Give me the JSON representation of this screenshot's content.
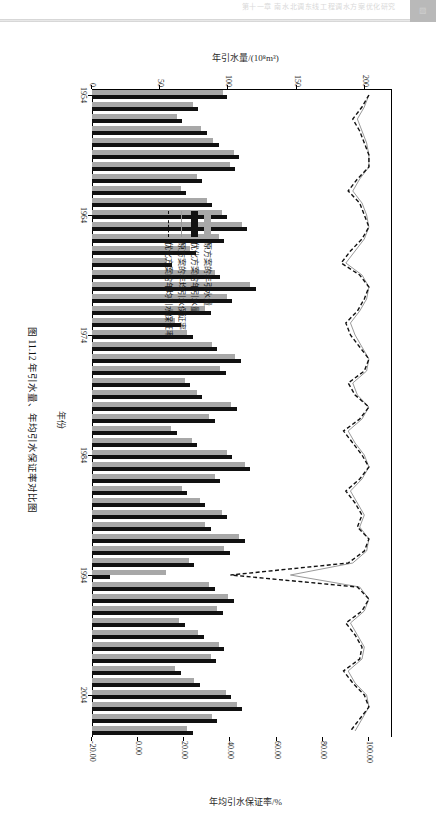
{
  "page": {
    "header_text": "第十一章  南水北调东线工程调水方案优化研究",
    "corner_glyph": "▨"
  },
  "figure": {
    "caption": "图 11.12  年引水量、年均引水保证率对比图",
    "x_axis_title": "年份",
    "y_left_title": "年引水量/(10⁸m³)",
    "y_right_title": "年均引水保证率/%",
    "legend": [
      {
        "label": "原方案的年引水量",
        "style": "bar-gray",
        "color": "#a8a8a8"
      },
      {
        "label": "优化方案的年引水量",
        "style": "bar-black",
        "color": "#111111"
      },
      {
        "label": "原方案的年均引水保证率",
        "style": "line-solid-gray",
        "color": "#9a9a9a"
      },
      {
        "label": "优化方案的年均引水保证率",
        "style": "line-dashed-black",
        "color": "#111111"
      }
    ]
  },
  "chart_data": {
    "type": "bar",
    "title": "图 11.12  年引水量、年均引水保证率对比图",
    "xlabel": "年份",
    "ylabel": "年引水量/(10⁸m³)",
    "y2label": "年均引水保证率/%",
    "ylim": [
      0,
      220
    ],
    "y2lim": [
      -20,
      110
    ],
    "yticks": [
      0,
      50,
      100,
      150,
      200
    ],
    "y2ticks": [
      -20.0,
      0.0,
      20.0,
      40.0,
      60.0,
      80.0,
      100.0
    ],
    "ytick_labels": [
      "0",
      "50",
      "100",
      "150",
      "200"
    ],
    "y2tick_labels": [
      "-20.00",
      "0.00",
      "20.00",
      "40.00",
      "60.00",
      "80.00",
      "100.00"
    ],
    "xticks": [
      1954,
      1964,
      1974,
      1984,
      1994,
      2004
    ],
    "xtick_labels": [
      "1954",
      "1964",
      "1974",
      "1984",
      "1994",
      "2004"
    ],
    "grid": false,
    "legend_position": "center",
    "categories": [
      1954,
      1955,
      1956,
      1957,
      1958,
      1959,
      1960,
      1961,
      1962,
      1963,
      1964,
      1965,
      1966,
      1967,
      1968,
      1969,
      1970,
      1971,
      1972,
      1973,
      1974,
      1975,
      1976,
      1977,
      1978,
      1979,
      1980,
      1981,
      1982,
      1983,
      1984,
      1985,
      1986,
      1987,
      1988,
      1989,
      1990,
      1991,
      1992,
      1993,
      1994,
      1995,
      1996,
      1997,
      1998,
      1999,
      2000,
      2001,
      2002,
      2003,
      2004,
      2005,
      2006,
      2007
    ],
    "series": [
      {
        "name": "原方案的年引水量",
        "type": "bar",
        "axis": "left",
        "color": "#a8a8a8",
        "values": [
          96,
          74,
          62,
          80,
          89,
          104,
          101,
          77,
          65,
          84,
          95,
          110,
          93,
          72,
          55,
          90,
          116,
          99,
          83,
          61,
          70,
          88,
          105,
          94,
          68,
          77,
          102,
          86,
          58,
          73,
          99,
          112,
          90,
          66,
          79,
          95,
          83,
          108,
          97,
          71,
          54,
          86,
          100,
          92,
          64,
          78,
          93,
          87,
          61,
          75,
          98,
          106,
          88,
          70
        ]
      },
      {
        "name": "优化方案的年引水量",
        "type": "bar",
        "axis": "left",
        "color": "#111111",
        "values": [
          99,
          78,
          66,
          84,
          93,
          108,
          105,
          81,
          69,
          88,
          99,
          114,
          97,
          76,
          59,
          94,
          120,
          103,
          87,
          65,
          74,
          92,
          109,
          98,
          72,
          81,
          106,
          90,
          62,
          77,
          103,
          116,
          94,
          70,
          83,
          99,
          87,
          112,
          101,
          75,
          13,
          90,
          104,
          96,
          68,
          82,
          97,
          91,
          65,
          79,
          102,
          110,
          92,
          74
        ]
      },
      {
        "name": "原方案的年均引水保证率",
        "type": "line",
        "axis": "right",
        "color": "#9a9a9a",
        "style": "solid",
        "values": [
          100,
          98,
          95,
          97,
          99,
          100,
          100,
          96,
          93,
          97,
          99,
          100,
          98,
          94,
          90,
          97,
          100,
          99,
          96,
          92,
          94,
          97,
          100,
          99,
          93,
          95,
          100,
          97,
          91,
          94,
          98,
          100,
          97,
          92,
          95,
          98,
          96,
          100,
          99,
          93,
          66,
          96,
          100,
          98,
          92,
          95,
          98,
          97,
          91,
          94,
          99,
          100,
          97,
          94
        ]
      },
      {
        "name": "优化方案的年均引水保证率",
        "type": "line",
        "axis": "right",
        "color": "#111111",
        "style": "dashed",
        "values": [
          100,
          97,
          93,
          96,
          98,
          100,
          100,
          95,
          91,
          96,
          98,
          100,
          97,
          92,
          88,
          96,
          100,
          98,
          95,
          90,
          92,
          96,
          100,
          98,
          91,
          94,
          100,
          96,
          89,
          93,
          97,
          100,
          96,
          90,
          94,
          97,
          95,
          100,
          98,
          91,
          40,
          95,
          100,
          97,
          90,
          94,
          97,
          96,
          89,
          93,
          98,
          100,
          96,
          92
        ]
      }
    ]
  }
}
